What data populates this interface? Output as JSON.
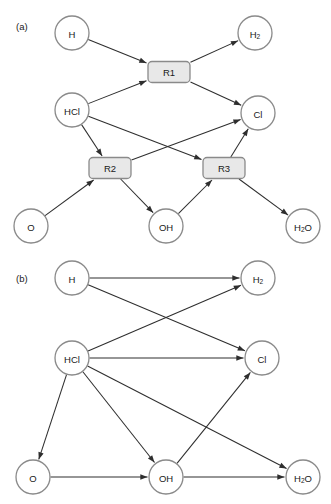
{
  "figure": {
    "width": 331,
    "height": 504,
    "background": "#ffffff",
    "node_fill": "#ffffff",
    "node_stroke": "#8a8a8a",
    "box_fill": "#e8e8e8",
    "box_stroke": "#8a8a8a",
    "edge_color": "#2e2e2e"
  },
  "panels": [
    {
      "id": "panel-a",
      "tag": "(a)",
      "tag_pos": {
        "x": 16,
        "y": 26
      },
      "nodes": [
        {
          "id": "a-H",
          "label": "H",
          "sub": "",
          "tail": "",
          "x": 72,
          "y": 33,
          "r": 17
        },
        {
          "id": "a-H2",
          "label": "H",
          "sub": "2",
          "tail": "",
          "x": 255,
          "y": 33,
          "r": 17
        },
        {
          "id": "a-HCl",
          "label": "HCl",
          "sub": "",
          "tail": "",
          "x": 72,
          "y": 110,
          "r": 17
        },
        {
          "id": "a-Cl",
          "label": "Cl",
          "sub": "",
          "tail": "",
          "x": 258,
          "y": 113,
          "r": 17
        },
        {
          "id": "a-O",
          "label": "O",
          "sub": "",
          "tail": "",
          "x": 31,
          "y": 226,
          "r": 17
        },
        {
          "id": "a-OH",
          "label": "OH",
          "sub": "",
          "tail": "",
          "x": 166,
          "y": 226,
          "r": 17
        },
        {
          "id": "a-H2O",
          "label": "H",
          "sub": "2",
          "tail": "O",
          "x": 303,
          "y": 226,
          "r": 17
        }
      ],
      "reactions": [
        {
          "id": "a-R1",
          "label": "R1",
          "x": 169,
          "y": 72,
          "w": 42,
          "h": 21
        },
        {
          "id": "a-R2",
          "label": "R2",
          "x": 110,
          "y": 168,
          "w": 42,
          "h": 21
        },
        {
          "id": "a-R3",
          "label": "R3",
          "x": 224,
          "y": 168,
          "w": 42,
          "h": 21
        }
      ],
      "edges": [
        {
          "from": "a-H",
          "to": "a-R1",
          "arrow": true
        },
        {
          "from": "a-HCl",
          "to": "a-R1",
          "arrow": true
        },
        {
          "from": "a-R1",
          "to": "a-H2",
          "arrow": true
        },
        {
          "from": "a-R1",
          "to": "a-Cl",
          "arrow": true
        },
        {
          "from": "a-HCl",
          "to": "a-R2",
          "arrow": true
        },
        {
          "from": "a-HCl",
          "to": "a-R3",
          "arrow": true
        },
        {
          "from": "a-O",
          "to": "a-R2",
          "arrow": true
        },
        {
          "from": "a-R2",
          "to": "a-Cl",
          "arrow": true
        },
        {
          "from": "a-R2",
          "to": "a-OH",
          "arrow": true
        },
        {
          "from": "a-OH",
          "to": "a-R3",
          "arrow": true
        },
        {
          "from": "a-R3",
          "to": "a-Cl",
          "arrow": true
        },
        {
          "from": "a-R3",
          "to": "a-H2O",
          "arrow": true
        }
      ]
    },
    {
      "id": "panel-b",
      "tag": "(b)",
      "tag_pos": {
        "x": 16,
        "y": 26
      },
      "nodes": [
        {
          "id": "b-H",
          "label": "H",
          "sub": "",
          "tail": "",
          "x": 72,
          "y": 26,
          "r": 17
        },
        {
          "id": "b-H2",
          "label": "H",
          "sub": "2",
          "tail": "",
          "x": 258,
          "y": 26,
          "r": 17
        },
        {
          "id": "b-HCl",
          "label": "HCl",
          "sub": "",
          "tail": "",
          "x": 72,
          "y": 106,
          "r": 17
        },
        {
          "id": "b-Cl",
          "label": "Cl",
          "sub": "",
          "tail": "",
          "x": 262,
          "y": 106,
          "r": 17
        },
        {
          "id": "b-O",
          "label": "O",
          "sub": "",
          "tail": "",
          "x": 33,
          "y": 225,
          "r": 17
        },
        {
          "id": "b-OH",
          "label": "OH",
          "sub": "",
          "tail": "",
          "x": 166,
          "y": 225,
          "r": 17
        },
        {
          "id": "b-H2O",
          "label": "H",
          "sub": "2",
          "tail": "O",
          "x": 303,
          "y": 225,
          "r": 17
        }
      ],
      "reactions": [],
      "edges": [
        {
          "from": "b-H",
          "to": "b-H2",
          "arrow": true
        },
        {
          "from": "b-H",
          "to": "b-Cl",
          "arrow": true
        },
        {
          "from": "b-HCl",
          "to": "b-H2",
          "arrow": true
        },
        {
          "from": "b-HCl",
          "to": "b-Cl",
          "arrow": true
        },
        {
          "from": "b-HCl",
          "to": "b-O",
          "arrow": true
        },
        {
          "from": "b-HCl",
          "to": "b-OH",
          "arrow": true
        },
        {
          "from": "b-HCl",
          "to": "b-H2O",
          "arrow": true
        },
        {
          "from": "b-O",
          "to": "b-OH",
          "arrow": true
        },
        {
          "from": "b-OH",
          "to": "b-Cl",
          "arrow": true
        },
        {
          "from": "b-OH",
          "to": "b-H2O",
          "arrow": true
        }
      ]
    }
  ]
}
